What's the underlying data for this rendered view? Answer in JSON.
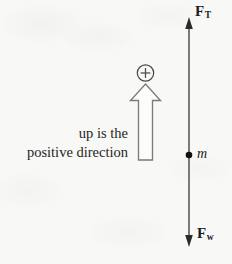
{
  "figure": {
    "background_color": "#f8f8f6",
    "ink_color": "#2b2b2b",
    "caption": {
      "line1": "up is the",
      "line2": "positive direction"
    },
    "sign_convention": {
      "symbol": "⊕",
      "meaning": "positive"
    },
    "axis": {
      "tension_label_base": "F",
      "tension_label_sub": "T",
      "weight_label_base": "F",
      "weight_label_sub": "w",
      "mass_label": "m"
    }
  }
}
